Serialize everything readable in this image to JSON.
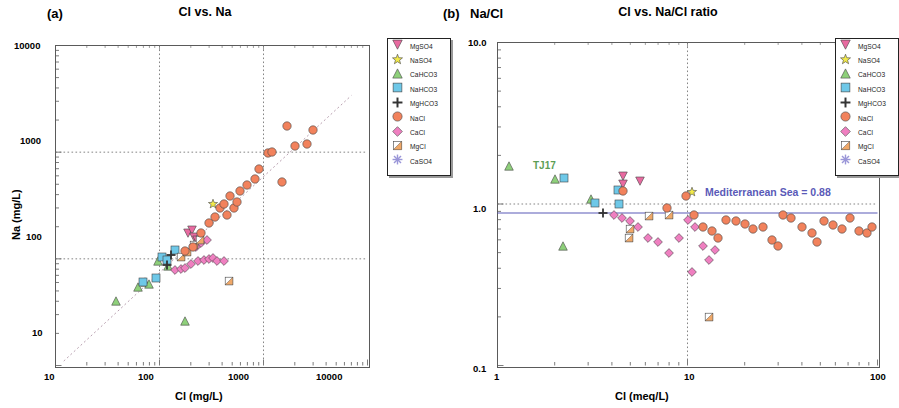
{
  "figure": {
    "panels": [
      {
        "tag": "(a)",
        "title": "Cl vs. Na",
        "xlabel": "Cl (mg/L)",
        "ylabel": "Na (mg/L)",
        "equation_line1": "Y = 0.85X + 0.102",
        "equation_line2": "r = 0.94",
        "xticks": [
          "10",
          "100",
          "1000",
          "10000"
        ],
        "yticks": [
          "10",
          "100",
          "1000",
          "10000"
        ]
      },
      {
        "tag": "(b)",
        "axis_corner_label": "Na/Cl",
        "title": "Cl vs. Na/Cl ratio",
        "xlabel": "Cl (meq/L)",
        "ylabel": "",
        "annotation": "Mediterranean Sea = 0.88",
        "point_label": "TJ17",
        "xticks": [
          "1",
          "10",
          "100"
        ],
        "yticks": [
          "0.1",
          "1.0",
          "10.0"
        ]
      }
    ],
    "legend_items": [
      {
        "label": "MgSO4",
        "shape": "triangle-down",
        "color": "#e86aa0"
      },
      {
        "label": "NaSO4",
        "shape": "star",
        "color": "#f2ea4a"
      },
      {
        "label": "CaHCO3",
        "shape": "triangle-up",
        "color": "#8ed07a"
      },
      {
        "label": "NaHCO3",
        "shape": "square",
        "color": "#6ec8e8"
      },
      {
        "label": "MgHCO3",
        "shape": "plus",
        "color": "#333333"
      },
      {
        "label": "NaCl",
        "shape": "circle",
        "color": "#f2825c"
      },
      {
        "label": "CaCl",
        "shape": "diamond",
        "color": "#ef7fc0"
      },
      {
        "label": "MgCl",
        "shape": "square-half",
        "color": "#f0a868"
      },
      {
        "label": "CaSO4",
        "shape": "asterisk",
        "color": "#9a96d8"
      }
    ],
    "colors": {
      "annotation": "#5a5ab8",
      "point_label": "#5c9e55",
      "frame": "#5a5a5a",
      "grid": "#777777",
      "regression": "#b9a0b0",
      "reference_line": "#5a5ab8"
    }
  },
  "chart_data": [
    {
      "type": "scatter",
      "panel": "a",
      "title": "Cl vs. Na",
      "xlabel": "Cl (mg/L)",
      "ylabel": "Na (mg/L)",
      "xlim": [
        10,
        10000
      ],
      "ylim": [
        10,
        10000
      ],
      "xscale": "log",
      "yscale": "log",
      "grid": true,
      "regression": {
        "slope": 0.85,
        "intercept": 0.102,
        "r": 0.94,
        "label": "Y = 0.85X + 0.102"
      },
      "series": [
        {
          "name": "CaHCO3",
          "points": [
            [
              38,
              40
            ],
            [
              62,
              55
            ],
            [
              72,
              60
            ],
            [
              97,
              95
            ],
            [
              120,
              85
            ],
            [
              175,
              26
            ],
            [
              80,
              58
            ]
          ]
        },
        {
          "name": "NaHCO3",
          "points": [
            [
              70,
              60
            ],
            [
              105,
              105
            ],
            [
              118,
              98
            ],
            [
              140,
              120
            ],
            [
              92,
              66
            ]
          ]
        },
        {
          "name": "MgHCO3",
          "points": [
            [
              128,
              108
            ],
            [
              118,
              88
            ]
          ]
        },
        {
          "name": "MgSO4",
          "points": [
            [
              190,
              175
            ],
            [
              205,
              185
            ],
            [
              215,
              160
            ],
            [
              230,
              150
            ]
          ]
        },
        {
          "name": "NaSO4",
          "points": [
            [
              330,
              330
            ]
          ]
        },
        {
          "name": "CaCl",
          "points": [
            [
              140,
              78
            ],
            [
              160,
              80
            ],
            [
              175,
              82
            ],
            [
              200,
              90
            ],
            [
              235,
              95
            ],
            [
              265,
              98
            ],
            [
              300,
              100
            ],
            [
              330,
              102
            ],
            [
              360,
              95
            ],
            [
              420,
              96
            ],
            [
              250,
              140
            ],
            [
              285,
              150
            ],
            [
              225,
              128
            ]
          ]
        },
        {
          "name": "MgCl",
          "points": [
            [
              160,
              105
            ],
            [
              185,
              115
            ],
            [
              215,
              135
            ],
            [
              245,
              150
            ],
            [
              470,
              62
            ]
          ]
        },
        {
          "name": "NaCl",
          "points": [
            [
              175,
              118
            ],
            [
              210,
              128
            ],
            [
              250,
              175
            ],
            [
              300,
              215
            ],
            [
              340,
              245
            ],
            [
              380,
              300
            ],
            [
              420,
              330
            ],
            [
              480,
              390
            ],
            [
              520,
              300
            ],
            [
              600,
              430
            ],
            [
              700,
              490
            ],
            [
              820,
              560
            ],
            [
              900,
              700
            ],
            [
              1100,
              980
            ],
            [
              1200,
              1000
            ],
            [
              1500,
              520
            ],
            [
              1700,
              1750
            ],
            [
              2000,
              1150
            ],
            [
              2600,
              1200
            ],
            [
              3000,
              1600
            ],
            [
              450,
              255
            ],
            [
              560,
              340
            ]
          ]
        },
        {
          "name": "CaSO4",
          "points": []
        }
      ]
    },
    {
      "type": "scatter",
      "panel": "b",
      "title": "Cl vs. Na/Cl ratio",
      "xlabel": "Cl (meq/L)",
      "ylabel": "Na/Cl",
      "xlim": [
        1,
        100
      ],
      "ylim": [
        0.1,
        10
      ],
      "xscale": "log",
      "yscale": "log",
      "grid": true,
      "reference": {
        "value": 0.88,
        "label": "Mediterranean Sea = 0.88"
      },
      "annotations": [
        {
          "text": "TJ17",
          "x": 1.25,
          "y": 1.72
        }
      ],
      "series": [
        {
          "name": "CaHCO3",
          "points": [
            [
              1.15,
              1.72
            ],
            [
              2.0,
              1.42
            ],
            [
              3.1,
              1.08
            ],
            [
              2.2,
              0.55
            ]
          ]
        },
        {
          "name": "NaHCO3",
          "points": [
            [
              2.25,
              1.45
            ],
            [
              3.25,
              1.02
            ],
            [
              4.3,
              1.22
            ],
            [
              4.35,
              1.0
            ]
          ]
        },
        {
          "name": "MgHCO3",
          "points": [
            [
              3.6,
              0.88
            ]
          ]
        },
        {
          "name": "MgSO4",
          "points": [
            [
              4.6,
              1.5
            ],
            [
              5.6,
              1.38
            ],
            [
              4.55,
              1.33
            ]
          ]
        },
        {
          "name": "NaSO4",
          "points": [
            [
              10.5,
              1.18
            ]
          ]
        },
        {
          "name": "CaCl",
          "points": [
            [
              4.1,
              0.85
            ],
            [
              4.5,
              0.82
            ],
            [
              5.0,
              0.78
            ],
            [
              5.5,
              0.72
            ],
            [
              6.2,
              0.62
            ],
            [
              7.0,
              0.58
            ],
            [
              8.0,
              0.5
            ],
            [
              9.0,
              0.62
            ],
            [
              10.0,
              0.8
            ],
            [
              11.0,
              0.72
            ],
            [
              12.0,
              0.55
            ],
            [
              13.0,
              0.45
            ],
            [
              10.5,
              0.38
            ],
            [
              14.0,
              0.52
            ]
          ]
        },
        {
          "name": "MgCl",
          "points": [
            [
              5.0,
              0.7
            ],
            [
              6.3,
              0.84
            ],
            [
              8.0,
              0.85
            ],
            [
              13.0,
              0.2
            ],
            [
              4.9,
              0.62
            ]
          ]
        },
        {
          "name": "NaCl",
          "points": [
            [
              4.6,
              1.2
            ],
            [
              7.8,
              0.95
            ],
            [
              9.8,
              1.12
            ],
            [
              10.8,
              0.86
            ],
            [
              12.0,
              0.72
            ],
            [
              13.5,
              0.68
            ],
            [
              14.5,
              0.62
            ],
            [
              16.0,
              0.8
            ],
            [
              18.0,
              0.78
            ],
            [
              20.0,
              0.75
            ],
            [
              22.0,
              0.7
            ],
            [
              25.0,
              0.72
            ],
            [
              28.0,
              0.6
            ],
            [
              32.0,
              0.85
            ],
            [
              35.0,
              0.82
            ],
            [
              40.0,
              0.72
            ],
            [
              45.0,
              0.66
            ],
            [
              52.0,
              0.78
            ],
            [
              58.0,
              0.74
            ],
            [
              65.0,
              0.7
            ],
            [
              72.0,
              0.82
            ],
            [
              80.0,
              0.68
            ],
            [
              88.0,
              0.66
            ],
            [
              94.0,
              0.72
            ],
            [
              30.0,
              0.55
            ],
            [
              48.0,
              0.58
            ]
          ]
        },
        {
          "name": "CaSO4",
          "points": []
        }
      ]
    }
  ]
}
